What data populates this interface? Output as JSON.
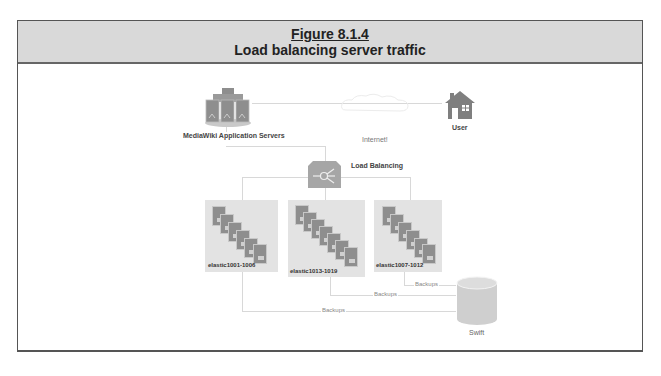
{
  "figure": {
    "number": "Figure 8.1.4",
    "title": "Load balancing server traffic"
  },
  "nodes": {
    "app_servers": {
      "label": "MediaWiki Application Servers",
      "icon": "server-cluster-icon"
    },
    "internet": {
      "label": "Internet!",
      "icon": "cloud-icon"
    },
    "user": {
      "label": "User",
      "icon": "house-icon"
    },
    "load_balancer": {
      "label": "Load Balancing",
      "icon": "load-balancer-icon"
    },
    "clusters": [
      {
        "label": "elastic1001-1006",
        "cards": 6
      },
      {
        "label": "elastic1013-1019",
        "cards": 7
      },
      {
        "label": "elastic1007-1012",
        "cards": 6
      }
    ],
    "storage": {
      "label": "Swift",
      "icon": "database-cylinder-icon"
    }
  },
  "edges": {
    "backup_labels": [
      "Backups",
      "Backups",
      "Backups"
    ]
  },
  "colors": {
    "header_bg": "#d9d9d9",
    "icon_gray": "#8e8e8e",
    "cluster_bg": "#e3e3e3",
    "line": "#d8d8d8"
  }
}
